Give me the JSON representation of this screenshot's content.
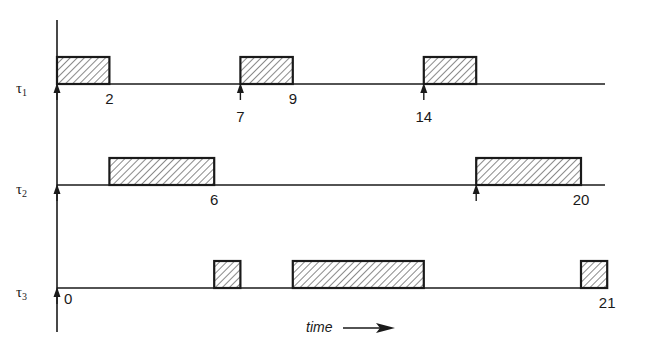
{
  "diagram": {
    "type": "timeline-schedule",
    "axis_label": "time",
    "origin_label": "0",
    "time_range": [
      0,
      21
    ],
    "colors": {
      "line": "#1a1a1a",
      "hatch": "#3a3a3a",
      "background": "#ffffff"
    },
    "tasks": [
      {
        "name": "τ",
        "subscript": "1",
        "arrivals": [
          0,
          7,
          14
        ],
        "executions": [
          [
            0,
            2
          ],
          [
            7,
            9
          ],
          [
            14,
            16
          ]
        ],
        "labels": [
          {
            "text": "2",
            "t": 2,
            "row": 1
          },
          {
            "text": "9",
            "t": 9,
            "row": 1
          },
          {
            "text": "7",
            "t": 7,
            "row": 2
          },
          {
            "text": "14",
            "t": 14,
            "row": 2
          }
        ]
      },
      {
        "name": "τ",
        "subscript": "2",
        "arrivals": [
          0,
          16
        ],
        "executions": [
          [
            2,
            6
          ],
          [
            16,
            20
          ]
        ],
        "labels": [
          {
            "text": "6",
            "t": 6,
            "row": 1
          },
          {
            "text": "20",
            "t": 20,
            "row": 1
          }
        ]
      },
      {
        "name": "τ",
        "subscript": "3",
        "arrivals": [
          0
        ],
        "executions": [
          [
            6,
            7
          ],
          [
            9,
            14
          ],
          [
            20,
            21
          ]
        ],
        "labels": [
          {
            "text": "21",
            "t": 21,
            "row": 1
          }
        ]
      }
    ]
  }
}
